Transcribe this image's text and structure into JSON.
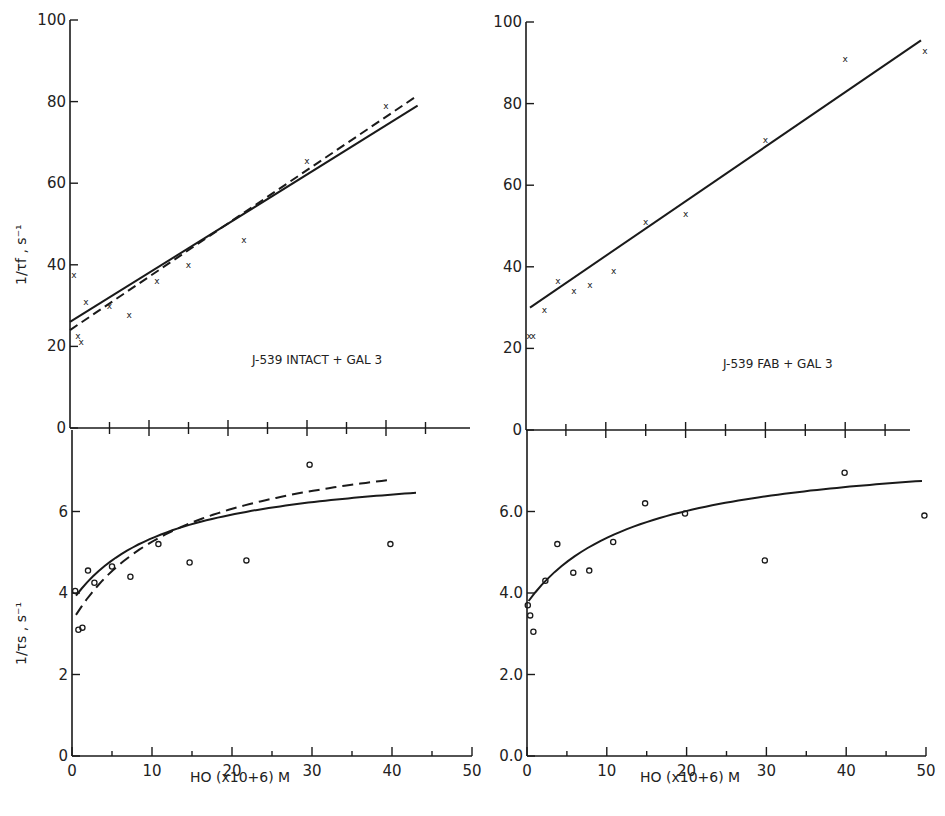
{
  "figure": {
    "x_axis_label_left": "HO (x10+6) M",
    "x_axis_label_right": "HO (x10+6) M",
    "y_label_top": "1/τf , s⁻¹",
    "y_label_bottom": "1/τs , s⁻¹",
    "annotation_left": "J-539 INTACT + GAL 3",
    "annotation_right": "J-539 FAB + GAL 3",
    "colors": {
      "ink": "#1a1a1a",
      "background": "#ffffff"
    }
  },
  "chart_data": [
    {
      "id": "top-left",
      "type": "scatter",
      "title": "J-539 INTACT + GAL 3",
      "xlabel": "HO (x10+6) M",
      "ylabel": "1/τf , s⁻¹",
      "xlim": [
        0,
        50
      ],
      "ylim": [
        0,
        100
      ],
      "yticks": [
        0,
        20,
        40,
        60,
        80,
        100
      ],
      "xticks": [
        0,
        5,
        10,
        15,
        20,
        25,
        30,
        35,
        40,
        45
      ],
      "marker": "x",
      "points": [
        {
          "x": 0.5,
          "y": 37.5
        },
        {
          "x": 1.0,
          "y": 22.5
        },
        {
          "x": 1.4,
          "y": 21
        },
        {
          "x": 2.0,
          "y": 31
        },
        {
          "x": 5.0,
          "y": 30
        },
        {
          "x": 7.5,
          "y": 27.7
        },
        {
          "x": 11,
          "y": 36
        },
        {
          "x": 15,
          "y": 40
        },
        {
          "x": 22,
          "y": 46
        },
        {
          "x": 30,
          "y": 65.5
        },
        {
          "x": 40,
          "y": 79
        }
      ],
      "lines": [
        {
          "name": "solid fit",
          "style": "solid",
          "x": [
            0,
            44
          ],
          "y": [
            26,
            79
          ]
        },
        {
          "name": "dashed fit",
          "style": "dashed",
          "x": [
            0,
            44
          ],
          "y": [
            24,
            81.5
          ]
        }
      ]
    },
    {
      "id": "bottom-left",
      "type": "scatter",
      "xlabel": "HO (x10+6) M",
      "ylabel": "1/τs , s⁻¹",
      "xlim": [
        0,
        50
      ],
      "ylim": [
        0,
        8
      ],
      "yticks": [
        0,
        2,
        4,
        6
      ],
      "ytick_labels": [
        "0",
        "2",
        "4",
        "6"
      ],
      "xticks": [
        0,
        10,
        20,
        30,
        40,
        50
      ],
      "marker": "o",
      "points": [
        {
          "x": 0.4,
          "y": 4.05
        },
        {
          "x": 0.8,
          "y": 3.1
        },
        {
          "x": 1.3,
          "y": 3.15
        },
        {
          "x": 2.0,
          "y": 4.55
        },
        {
          "x": 2.8,
          "y": 4.25
        },
        {
          "x": 5.0,
          "y": 4.65
        },
        {
          "x": 7.3,
          "y": 4.4
        },
        {
          "x": 10.8,
          "y": 5.2
        },
        {
          "x": 14.7,
          "y": 4.75
        },
        {
          "x": 21.8,
          "y": 4.8
        },
        {
          "x": 29.7,
          "y": 7.15
        },
        {
          "x": 39.8,
          "y": 5.2
        }
      ],
      "curves": [
        {
          "name": "solid fit",
          "style": "solid",
          "y0": 3.8,
          "ymax_asym": 7.2,
          "k": 12,
          "x_range": [
            0.5,
            43
          ]
        },
        {
          "name": "dashed fit",
          "style": "dashed",
          "y0": 3.3,
          "ymax_asym": 8.0,
          "k": 14,
          "x_range": [
            0.5,
            40
          ]
        }
      ]
    },
    {
      "id": "top-right",
      "type": "scatter",
      "title": "J-539 FAB + GAL 3",
      "ylabel": "",
      "xlim": [
        0,
        50
      ],
      "ylim": [
        0,
        100
      ],
      "yticks": [
        0,
        20,
        40,
        60,
        80,
        100
      ],
      "xticks": [
        0,
        5,
        10,
        15,
        20,
        25,
        30,
        35,
        40,
        45
      ],
      "marker": "x",
      "points": [
        {
          "x": 0.4,
          "y": 23
        },
        {
          "x": 0.9,
          "y": 23
        },
        {
          "x": 2.3,
          "y": 29.5
        },
        {
          "x": 4.0,
          "y": 36.5
        },
        {
          "x": 6.0,
          "y": 34
        },
        {
          "x": 8.0,
          "y": 35.5
        },
        {
          "x": 11,
          "y": 39
        },
        {
          "x": 15,
          "y": 51
        },
        {
          "x": 20,
          "y": 53
        },
        {
          "x": 30,
          "y": 71
        },
        {
          "x": 40,
          "y": 91
        },
        {
          "x": 50,
          "y": 93
        }
      ],
      "lines": [
        {
          "name": "fit",
          "style": "solid",
          "x": [
            0.5,
            49.5
          ],
          "y": [
            30,
            95.5
          ]
        }
      ]
    },
    {
      "id": "bottom-right",
      "type": "scatter",
      "xlabel": "HO (x10+6) M",
      "ylabel": "",
      "xlim": [
        0,
        50
      ],
      "ylim": [
        0,
        8
      ],
      "yticks": [
        0,
        2,
        4,
        6
      ],
      "ytick_labels": [
        "0.0",
        "2.0",
        "4.0",
        "6.0"
      ],
      "xticks": [
        0,
        10,
        20,
        30,
        40,
        50
      ],
      "marker": "o",
      "points": [
        {
          "x": 0.1,
          "y": 3.7
        },
        {
          "x": 0.4,
          "y": 3.45
        },
        {
          "x": 0.8,
          "y": 3.05
        },
        {
          "x": 2.3,
          "y": 4.3
        },
        {
          "x": 3.8,
          "y": 5.2
        },
        {
          "x": 5.8,
          "y": 4.5
        },
        {
          "x": 7.8,
          "y": 4.55
        },
        {
          "x": 10.8,
          "y": 5.25
        },
        {
          "x": 14.8,
          "y": 6.2
        },
        {
          "x": 19.8,
          "y": 5.95
        },
        {
          "x": 29.8,
          "y": 4.8
        },
        {
          "x": 39.8,
          "y": 6.95
        },
        {
          "x": 49.8,
          "y": 5.9
        }
      ],
      "curves": [
        {
          "name": "fit",
          "style": "solid",
          "y0": 3.75,
          "ymax_asym": 7.6,
          "k": 14,
          "x_range": [
            0.2,
            49.5
          ]
        }
      ]
    }
  ]
}
